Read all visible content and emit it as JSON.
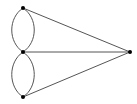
{
  "diagram": {
    "type": "graph",
    "vertices": [
      {
        "id": "top",
        "x": 23,
        "y": 8
      },
      {
        "id": "middle",
        "x": 23,
        "y": 52
      },
      {
        "id": "bottom",
        "x": 23,
        "y": 97
      },
      {
        "id": "right",
        "x": 130,
        "y": 52
      }
    ],
    "edges": [
      {
        "from": "top",
        "to": "middle",
        "shape": "arc-left"
      },
      {
        "from": "top",
        "to": "middle",
        "shape": "arc-right"
      },
      {
        "from": "middle",
        "to": "bottom",
        "shape": "arc-left"
      },
      {
        "from": "middle",
        "to": "bottom",
        "shape": "arc-right"
      },
      {
        "from": "top",
        "to": "right",
        "shape": "line"
      },
      {
        "from": "middle",
        "to": "right",
        "shape": "line"
      },
      {
        "from": "bottom",
        "to": "right",
        "shape": "line"
      }
    ],
    "colors": {
      "edge": "#555555",
      "vertex": "#000000"
    }
  }
}
